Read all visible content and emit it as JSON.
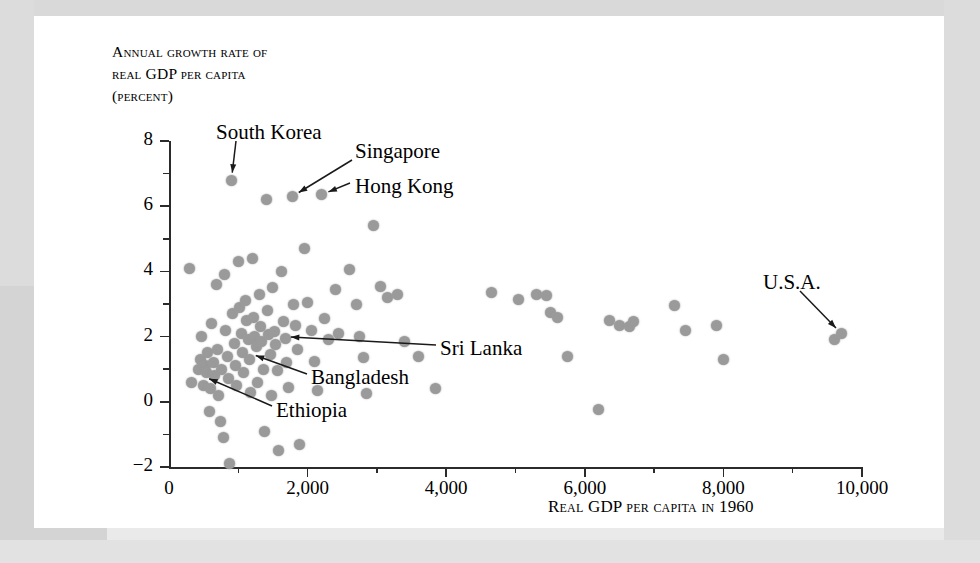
{
  "page": {
    "margin_folio": "0"
  },
  "chart_data": {
    "type": "scatter",
    "title": "",
    "ylabel_lines": [
      "Annual growth rate of",
      "real GDP per capita",
      "(percent)"
    ],
    "ylabel_full": "Annual growth rate of real GDP per capita (percent)",
    "xlabel": "Real GDP per capita in 1960",
    "xlim": [
      0,
      10000
    ],
    "ylim": [
      -2,
      8
    ],
    "xticks": [
      0,
      2000,
      4000,
      6000,
      8000,
      10000
    ],
    "xtick_labels": [
      "0",
      "2,000",
      "4,000",
      "6,000",
      "8,000",
      "10,000"
    ],
    "xminor_ticks": [
      1000,
      3000,
      5000,
      7000,
      9000
    ],
    "yticks": [
      -2,
      0,
      2,
      4,
      6,
      8
    ],
    "ytick_labels": [
      "-2",
      "0",
      "2",
      "4",
      "6",
      "8"
    ],
    "yminor_ticks": [
      -1,
      1,
      3,
      5,
      7
    ],
    "grid": false,
    "legend": null,
    "marker_color": "#9a9a9a",
    "axis_color": "#2b2b2b",
    "xlabel_note": "1960",
    "points": [
      [
        300,
        4.1
      ],
      [
        330,
        0.6
      ],
      [
        420,
        1.0
      ],
      [
        450,
        1.3
      ],
      [
        470,
        2.0
      ],
      [
        500,
        0.5
      ],
      [
        520,
        1.1
      ],
      [
        540,
        0.9
      ],
      [
        560,
        1.5
      ],
      [
        580,
        -0.3
      ],
      [
        600,
        0.4
      ],
      [
        620,
        2.4
      ],
      [
        640,
        1.2
      ],
      [
        660,
        0.8
      ],
      [
        680,
        3.6
      ],
      [
        700,
        1.6
      ],
      [
        720,
        0.2
      ],
      [
        740,
        -0.6
      ],
      [
        760,
        1.0
      ],
      [
        780,
        -1.1
      ],
      [
        800,
        3.9
      ],
      [
        820,
        2.2
      ],
      [
        840,
        1.4
      ],
      [
        860,
        0.7
      ],
      [
        880,
        -1.9
      ],
      [
        900,
        6.8
      ],
      [
        920,
        2.7
      ],
      [
        940,
        1.8
      ],
      [
        960,
        1.1
      ],
      [
        980,
        0.5
      ],
      [
        1000,
        4.3
      ],
      [
        1020,
        2.9
      ],
      [
        1040,
        2.1
      ],
      [
        1060,
        1.5
      ],
      [
        1080,
        0.9
      ],
      [
        1100,
        3.1
      ],
      [
        1120,
        2.5
      ],
      [
        1140,
        1.9
      ],
      [
        1160,
        1.3
      ],
      [
        1180,
        0.3
      ],
      [
        1200,
        4.4
      ],
      [
        1220,
        2.6
      ],
      [
        1240,
        2.0
      ],
      [
        1260,
        1.7
      ],
      [
        1280,
        0.6
      ],
      [
        1300,
        3.3
      ],
      [
        1320,
        2.3
      ],
      [
        1340,
        1.85
      ],
      [
        1360,
        1.0
      ],
      [
        1380,
        -0.9
      ],
      [
        1400,
        6.2
      ],
      [
        1420,
        2.8
      ],
      [
        1440,
        2.05
      ],
      [
        1460,
        1.45
      ],
      [
        1480,
        0.2
      ],
      [
        1500,
        3.5
      ],
      [
        1520,
        2.15
      ],
      [
        1540,
        1.75
      ],
      [
        1560,
        0.95
      ],
      [
        1580,
        -1.5
      ],
      [
        1620,
        4.0
      ],
      [
        1650,
        2.45
      ],
      [
        1680,
        1.95
      ],
      [
        1700,
        1.2
      ],
      [
        1720,
        0.45
      ],
      [
        1780,
        6.3
      ],
      [
        1800,
        3.0
      ],
      [
        1820,
        2.35
      ],
      [
        1850,
        1.6
      ],
      [
        1880,
        -1.3
      ],
      [
        1950,
        4.7
      ],
      [
        2000,
        3.05
      ],
      [
        2050,
        2.2
      ],
      [
        2100,
        1.25
      ],
      [
        2150,
        0.35
      ],
      [
        2200,
        6.35
      ],
      [
        2250,
        2.55
      ],
      [
        2300,
        1.9
      ],
      [
        2400,
        3.45
      ],
      [
        2450,
        2.1
      ],
      [
        2600,
        4.05
      ],
      [
        2700,
        3.0
      ],
      [
        2750,
        2.0
      ],
      [
        2800,
        1.35
      ],
      [
        2850,
        0.25
      ],
      [
        2950,
        5.4
      ],
      [
        3050,
        3.55
      ],
      [
        3150,
        3.2
      ],
      [
        3300,
        3.3
      ],
      [
        3400,
        1.85
      ],
      [
        3600,
        1.4
      ],
      [
        3850,
        0.4
      ],
      [
        4650,
        3.35
      ],
      [
        5050,
        3.15
      ],
      [
        5300,
        3.3
      ],
      [
        5450,
        3.25
      ],
      [
        5500,
        2.75
      ],
      [
        5600,
        2.6
      ],
      [
        5750,
        1.4
      ],
      [
        6200,
        -0.25
      ],
      [
        6350,
        2.5
      ],
      [
        6500,
        2.35
      ],
      [
        6650,
        2.3
      ],
      [
        6700,
        2.45
      ],
      [
        7300,
        2.95
      ],
      [
        7450,
        2.2
      ],
      [
        7900,
        2.35
      ],
      [
        8000,
        1.3
      ],
      [
        9600,
        1.9
      ],
      [
        9700,
        2.1
      ]
    ],
    "annotations": [
      {
        "label": "South Korea",
        "point": [
          900,
          6.8
        ],
        "arrow": true
      },
      {
        "label": "Singapore",
        "point": [
          1780,
          6.3
        ],
        "arrow": true
      },
      {
        "label": "Hong Kong",
        "point": [
          2200,
          6.35
        ],
        "arrow": true
      },
      {
        "label": "Sri Lanka",
        "point": [
          1650,
          2.0
        ],
        "arrow": true
      },
      {
        "label": "Bangladesh",
        "point": [
          1150,
          1.5
        ],
        "arrow": true
      },
      {
        "label": "Ethiopia",
        "point": [
          480,
          0.8
        ],
        "arrow": true
      },
      {
        "label": "U.S.A.",
        "point": [
          9700,
          2.1
        ],
        "arrow": true
      }
    ]
  }
}
